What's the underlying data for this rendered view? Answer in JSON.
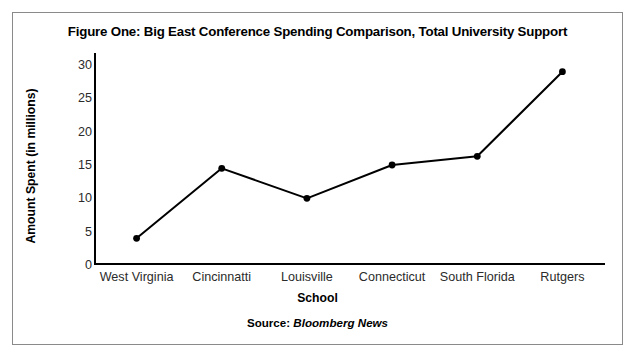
{
  "figure": {
    "title": "Figure One: Big East Conference Spending Comparison, Total University Support",
    "source_label": "Source:",
    "source_publication": "Bloomberg News"
  },
  "chart_data": {
    "type": "line",
    "title": "Figure One: Big East Conference Spending Comparison, Total University Support",
    "xlabel": "School",
    "ylabel": "Amount Spent (in millions)",
    "categories": [
      "West Virginia",
      "Cincinnatti",
      "Louisville",
      "Connecticut",
      "South Florida",
      "Rutgers"
    ],
    "values": [
      4.0,
      14.5,
      10.0,
      15.0,
      16.3,
      29.0
    ],
    "ylim": [
      0,
      30
    ],
    "y_ticks": [
      0,
      5,
      10,
      15,
      20,
      25,
      30
    ],
    "grid": false,
    "legend": false,
    "series_color": "#000000",
    "marker": "circle",
    "spines": [
      "left",
      "bottom"
    ]
  }
}
